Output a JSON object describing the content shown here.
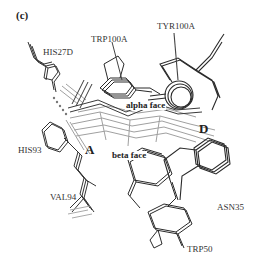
{
  "figure": {
    "panel_label": "(c)",
    "residues": [
      {
        "name": "HIS27D",
        "x": 43,
        "y": 48
      },
      {
        "name": "TRP100A",
        "x": 91,
        "y": 35
      },
      {
        "name": "TYR100A",
        "x": 157,
        "y": 22
      },
      {
        "name": "HIS93",
        "x": 18,
        "y": 146
      },
      {
        "name": "VAL94",
        "x": 50,
        "y": 193
      },
      {
        "name": "ASN35",
        "x": 217,
        "y": 203
      },
      {
        "name": "TRP50",
        "x": 187,
        "y": 245
      }
    ],
    "faces": {
      "alpha": "alpha face",
      "beta": "beta face"
    },
    "rings": {
      "a": "A",
      "d": "D"
    },
    "colors": {
      "dark_bonds": "#2a2a2a",
      "light_bonds": "#9a9a9a",
      "hbond_dots": "#777777",
      "background": "#ffffff"
    }
  }
}
